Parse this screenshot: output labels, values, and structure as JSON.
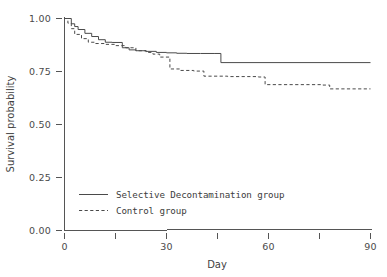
{
  "chart_data": {
    "type": "line",
    "subtype": "kaplan-meier-step",
    "title": "",
    "xlabel": "Day",
    "ylabel": "Survival probability",
    "xlim": [
      0,
      90
    ],
    "ylim": [
      0,
      1
    ],
    "grid": false,
    "legend_position": "inside-lower-left",
    "xticks": [
      0,
      15,
      30,
      45,
      60,
      75,
      90
    ],
    "xtick_labels": [
      "0",
      "",
      "30",
      "",
      "60",
      "",
      "90"
    ],
    "yticks": [
      0,
      0.25,
      0.5,
      0.75,
      1
    ],
    "ytick_labels": [
      "0.00",
      "0.25",
      "0.50",
      "0.75",
      "1.00"
    ],
    "series": [
      {
        "name": "Selective Decontamination group",
        "style": "solid",
        "color": "#4a4a4a",
        "x": [
          0,
          1,
          2,
          3,
          4,
          6,
          8,
          10,
          12,
          14,
          17,
          19,
          21,
          24,
          27,
          30,
          33,
          36,
          40,
          44,
          46,
          90
        ],
        "y": [
          1.0,
          1.0,
          0.975,
          0.962,
          0.948,
          0.93,
          0.915,
          0.9,
          0.888,
          0.887,
          0.862,
          0.852,
          0.848,
          0.845,
          0.84,
          0.838,
          0.836,
          0.835,
          0.835,
          0.835,
          0.792,
          0.792
        ]
      },
      {
        "name": "Control group",
        "style": "dashed",
        "color": "#4a4a4a",
        "x": [
          0,
          1,
          2,
          3,
          5,
          7,
          9,
          12,
          15,
          18,
          21,
          24,
          26,
          28,
          31,
          34,
          38,
          41,
          48,
          57,
          59,
          76,
          78,
          90
        ],
        "y": [
          1.0,
          0.978,
          0.952,
          0.925,
          0.905,
          0.888,
          0.882,
          0.878,
          0.872,
          0.862,
          0.848,
          0.84,
          0.832,
          0.818,
          0.762,
          0.755,
          0.752,
          0.728,
          0.726,
          0.724,
          0.688,
          0.686,
          0.668,
          0.668
        ]
      }
    ],
    "legend": [
      {
        "label": "Selective Decontamination group",
        "style": "solid"
      },
      {
        "label": "Control group",
        "style": "dashed"
      }
    ]
  },
  "axes": {
    "y_title": "Survival probability",
    "x_title": "Day",
    "y_labels": [
      "1.00",
      "0.75",
      "0.50",
      "0.25",
      "0.00"
    ],
    "x_labels": [
      "0",
      "30",
      "60",
      "90"
    ]
  },
  "legend": {
    "entry_1": "Selective Decontamination group",
    "entry_2": "Control group"
  }
}
